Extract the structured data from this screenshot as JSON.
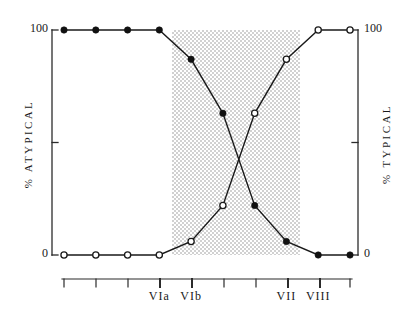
{
  "chart_data": {
    "type": "line",
    "title": "",
    "subtitle": "",
    "xlabel": "",
    "ylabel": "% ATYPICAL",
    "ylabel_right": "% TYPICAL",
    "ylim": [
      0,
      100
    ],
    "y_ticks": [
      0,
      50,
      100
    ],
    "y_tick_labels_shown": [
      "0",
      "100"
    ],
    "grid": false,
    "legend": "none",
    "x": [
      1,
      2,
      3,
      4,
      5,
      6,
      7,
      8,
      9,
      10
    ],
    "categories": [
      "",
      "",
      "",
      "VIa",
      "VIb",
      "",
      "",
      "VII",
      "VIII",
      ""
    ],
    "x_tick_labels": [
      {
        "index": 0,
        "label": ""
      },
      {
        "index": 1,
        "label": ""
      },
      {
        "index": 2,
        "label": ""
      },
      {
        "index": 3,
        "label": "VIa"
      },
      {
        "index": 4,
        "label": "VIb"
      },
      {
        "index": 5,
        "label": ""
      },
      {
        "index": 6,
        "label": ""
      },
      {
        "index": 7,
        "label": "VII"
      },
      {
        "index": 8,
        "label": "VIII"
      },
      {
        "index": 9,
        "label": ""
      }
    ],
    "series": [
      {
        "name": "% ATYPICAL",
        "marker": "filled-circle",
        "values": [
          100,
          100,
          100,
          100,
          87,
          63,
          22,
          6,
          0,
          0
        ]
      },
      {
        "name": "% TYPICAL",
        "marker": "open-circle",
        "values": [
          0,
          0,
          0,
          0,
          6,
          22,
          63,
          87,
          100,
          100
        ]
      }
    ],
    "shaded_band": {
      "from_index": 4,
      "to_index": 8,
      "fill": "#d9d9d9",
      "description": "stippled transition zone"
    },
    "annotations": []
  },
  "axes": {
    "left": {
      "label": "% ATYPICAL",
      "top_tick_label": "100",
      "bottom_tick_label": "0"
    },
    "right": {
      "label": "% TYPICAL",
      "top_tick_label": "100",
      "bottom_tick_label": "0"
    }
  },
  "colors": {
    "line": "#1a1a1a",
    "marker_fill": "#111111",
    "marker_open_fill": "#ffffff",
    "band": "#d7d7d7",
    "background": "#ffffff",
    "axis": "#2b2b2b"
  }
}
